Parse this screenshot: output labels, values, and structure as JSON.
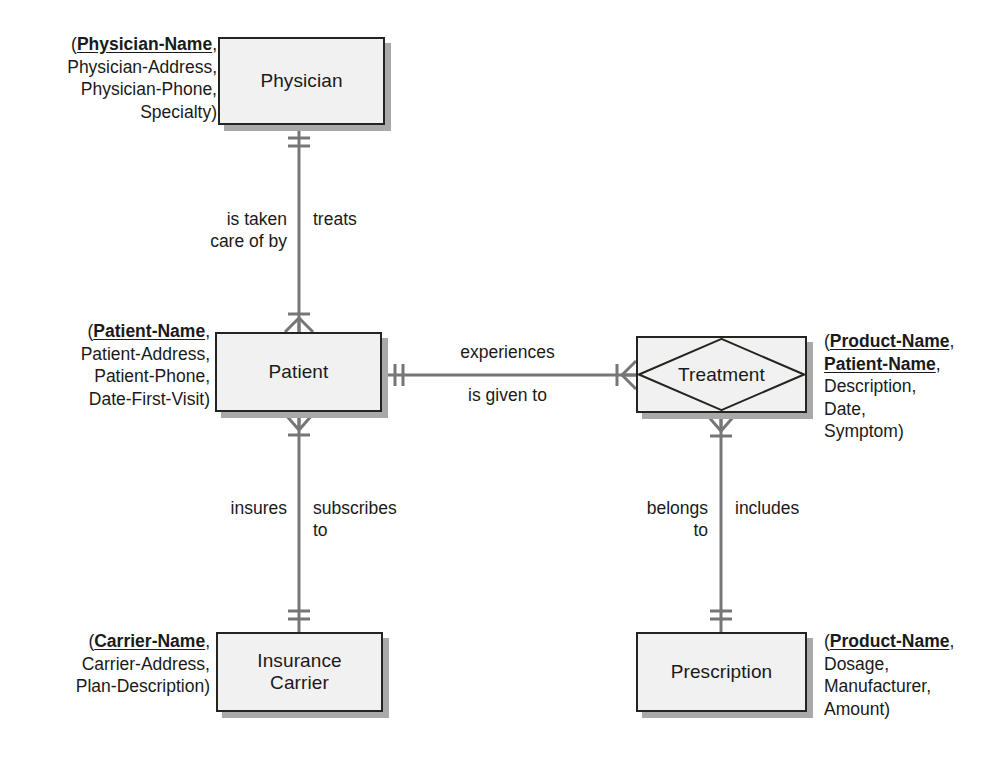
{
  "diagram": {
    "notation": "crow's-foot",
    "line_color": "#767676",
    "entity_fill": "#f1f1f1",
    "entity_border": "#23241f",
    "shadow_color": "#a9a9a9"
  },
  "entities": {
    "physician": {
      "name": "Physician",
      "attributes_text": "(Physician-Name,\nPhysician-Address,\nPhysician-Phone,\nSpecialty)",
      "key_attribute": "Physician-Name",
      "attribute_list": [
        "Physician-Name",
        "Physician-Address",
        "Physician-Phone",
        "Specialty"
      ]
    },
    "patient": {
      "name": "Patient",
      "attributes_text": "(Patient-Name,\nPatient-Address,\nPatient-Phone,\nDate-First-Visit)",
      "key_attribute": "Patient-Name",
      "attribute_list": [
        "Patient-Name",
        "Patient-Address",
        "Patient-Phone",
        "Date-First-Visit"
      ]
    },
    "insurance_carrier": {
      "name": "Insurance\nCarrier",
      "attributes_text": "(Carrier-Name,\nCarrier-Address,\nPlan-Description)",
      "key_attribute": "Carrier-Name",
      "attribute_list": [
        "Carrier-Name",
        "Carrier-Address",
        "Plan-Description"
      ]
    },
    "treatment": {
      "name": "Treatment",
      "shape": "associative-entity",
      "attributes_text": "(Product-Name,\nPatient-Name,\nDescription,\nDate,\nSymptom)",
      "key_attributes": [
        "Product-Name",
        "Patient-Name"
      ],
      "attribute_list": [
        "Product-Name",
        "Patient-Name",
        "Description",
        "Date",
        "Symptom"
      ]
    },
    "prescription": {
      "name": "Prescription",
      "attributes_text": "(Product-Name,\nDosage,\nManufacturer,\nAmount)",
      "key_attribute": "Product-Name",
      "attribute_list": [
        "Product-Name",
        "Dosage",
        "Manufacturer",
        "Amount"
      ]
    }
  },
  "relationships": {
    "physician_patient": {
      "left_label": "is taken\ncare of by",
      "right_label": "treats",
      "from": "Physician",
      "to": "Patient",
      "from_cardinality": "one-and-only-one",
      "to_cardinality": "one-to-many"
    },
    "patient_treatment": {
      "above_label": "experiences",
      "below_label": "is given to",
      "from": "Patient",
      "to": "Treatment",
      "from_cardinality": "one-and-only-one",
      "to_cardinality": "one-to-many"
    },
    "patient_carrier": {
      "left_label": "insures",
      "right_label": "subscribes\nto",
      "from": "Patient",
      "to": "Insurance Carrier",
      "from_cardinality": "one-to-many",
      "to_cardinality": "one-and-only-one"
    },
    "treatment_prescription": {
      "left_label": "belongs\nto",
      "right_label": "includes",
      "from": "Treatment",
      "to": "Prescription",
      "from_cardinality": "one-to-many",
      "to_cardinality": "one-and-only-one"
    }
  }
}
